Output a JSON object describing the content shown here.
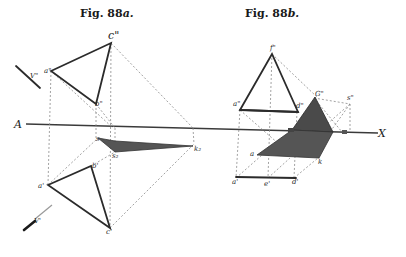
{
  "figures": {
    "fig_a": {
      "caption_prefix": "Fig.",
      "caption_number": "88",
      "caption_suffix": "a."
    },
    "fig_b": {
      "caption_prefix": "Fig.",
      "caption_number": "88",
      "caption_suffix": "b."
    }
  },
  "axis": {
    "left_label": "A",
    "right_label": "X"
  },
  "labels_a": {
    "c_upper": "c\"",
    "a_upper": "a\"",
    "b_upper": "b\"",
    "V_upper": "V\"",
    "s_axis": "s",
    "s2": "s₂",
    "k2": "k₂",
    "a_lower": "a'",
    "b_lower": "b'",
    "c_lower": "c'",
    "V_lower": "V'"
  },
  "labels_b": {
    "f_upper": "f\"",
    "a_upper": "a\"",
    "d_upper": "d\"",
    "G_upper": "G\"",
    "s_upper": "s\"",
    "a_shadow": "a",
    "k_shadow": "k",
    "a_lower": "a'",
    "e_lower": "e'",
    "d_lower": "d'"
  },
  "colors": {
    "ink": "#2b2b2b",
    "shadow": "#555555",
    "construction": "#8a8a8a",
    "paper": "#ffffff"
  }
}
